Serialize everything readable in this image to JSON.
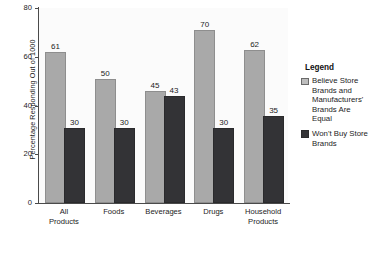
{
  "chart_data": {
    "type": "bar",
    "title": "",
    "xlabel": "",
    "ylabel": "Percentage Responding Out of 1000",
    "ylim": [
      0,
      80
    ],
    "yticks": [
      0,
      20,
      40,
      60,
      80
    ],
    "grid": false,
    "legend_position": "right",
    "legend_title": "Legend",
    "categories": [
      "All Products",
      "Foods",
      "Beverages",
      "Drugs",
      "Household Products"
    ],
    "category_lines": [
      [
        "All",
        "Products"
      ],
      [
        "Foods"
      ],
      [
        "Beverages"
      ],
      [
        "Drugs"
      ],
      [
        "Household",
        "Products"
      ]
    ],
    "series": [
      {
        "name": "Believe Store Brands and Manufacturers' Brands Are Equal",
        "color": "#a9a9a9",
        "values": [
          61,
          50,
          45,
          70,
          62
        ]
      },
      {
        "name": "Won't Buy Store Brands",
        "color": "#333336",
        "values": [
          30,
          30,
          43,
          30,
          35
        ]
      }
    ]
  },
  "legend": {
    "title": "Legend",
    "entries": [
      {
        "label": "Believe Store Brands and Manufacturers' Brands Are Equal",
        "swatch": "light"
      },
      {
        "label": "Won't Buy Store Brands",
        "swatch": "dark"
      }
    ]
  },
  "axis": {
    "y_title": "Percentage Responding Out of 1000",
    "y_ticks": [
      "0",
      "20",
      "40",
      "60",
      "80"
    ]
  },
  "colors": {
    "series_light": "#a9a9a9",
    "series_dark": "#333336",
    "axis": "#4a4a4a",
    "plot_background": "#fbfbfb",
    "text": "#1c1c1c"
  }
}
